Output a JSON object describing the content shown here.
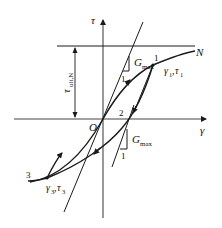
{
  "figure": {
    "type": "stress-strain hysteresis diagram (Masing-type loading/unloading)",
    "axes": {
      "y_label": "τ",
      "x_label": "γ",
      "origin_label": "O"
    },
    "asymptote": {
      "label": "τ",
      "label_sub": "ult,N",
      "curve_end_label": "N"
    },
    "slopes": {
      "top": {
        "label": "G",
        "sub": "max",
        "run_label": "1"
      },
      "bottom": {
        "label": "G",
        "sub": "max",
        "run_label": "1"
      }
    },
    "points": {
      "p1": {
        "number": "1",
        "coord_label_a": "γ",
        "coord_sub_a": "1",
        "coord_label_b": "τ",
        "coord_sub_b": "1",
        "sep": ","
      },
      "p2": {
        "number": "2"
      },
      "p3": {
        "number": "3",
        "coord_label_a": "γ",
        "coord_sub_a": "3",
        "coord_label_b": "τ",
        "coord_sub_b": "3",
        "sep": ","
      }
    },
    "colors": {
      "line": "#1a1a1a",
      "axis": "#444444",
      "background": "#ffffff"
    }
  }
}
